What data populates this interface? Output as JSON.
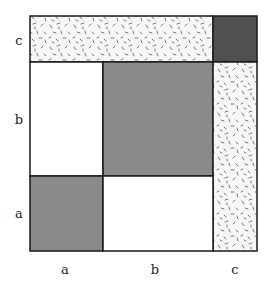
{
  "diagram": {
    "type": "area-model-square",
    "colors": {
      "gray": "#8a8a8a",
      "dark": "#505050",
      "white": "#ffffff",
      "speckled_bg": "#f7f7f7",
      "stroke": "#1a1a1a"
    },
    "row_labels": {
      "c": "c",
      "b": "b",
      "a": "a"
    },
    "col_labels": {
      "a": "a",
      "b": "b",
      "c": "c"
    },
    "cells": [
      {
        "row": "c",
        "col": "a+b",
        "fill": "speckled",
        "note": "c×(a+b) strip"
      },
      {
        "row": "c",
        "col": "c",
        "fill": "dark"
      },
      {
        "row": "b",
        "col": "a",
        "fill": "white"
      },
      {
        "row": "b",
        "col": "b",
        "fill": "gray"
      },
      {
        "row": "a+b",
        "col": "c",
        "fill": "speckled",
        "note": "(a+b)×c strip"
      },
      {
        "row": "a",
        "col": "a",
        "fill": "gray"
      },
      {
        "row": "a",
        "col": "b",
        "fill": "white"
      }
    ]
  }
}
